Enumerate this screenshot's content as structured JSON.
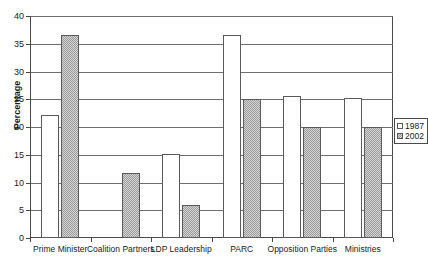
{
  "chart_data": {
    "type": "bar",
    "title": "",
    "xlabel": "",
    "ylabel": "Percentage",
    "ylim": [
      0,
      40
    ],
    "ytick_step": 5,
    "yticks": [
      "0",
      "5",
      "10",
      "15",
      "20",
      "25",
      "30",
      "35",
      "40"
    ],
    "grid": true,
    "legend_position": "right",
    "categories": [
      "Prime Minister",
      "Coalition Partners",
      "LDP Leadership",
      "PARC",
      "Opposition Parties",
      "Ministries"
    ],
    "series": [
      {
        "name": "1987",
        "fill": "white",
        "values": [
          22.2,
          0,
          15.2,
          36.5,
          25.5,
          25.3
        ]
      },
      {
        "name": "2002",
        "fill": "hatched-gray",
        "values": [
          36.5,
          11.8,
          6.0,
          25.0,
          20.0,
          20.0
        ]
      }
    ]
  },
  "legend": {
    "entries": [
      {
        "label": "1987"
      },
      {
        "label": "2002"
      }
    ]
  },
  "colors": {
    "series_1987": "#ffffff",
    "series_2002": "#9d9d9d",
    "axis": "#4a4a4a",
    "gridline": "#6e6e6e",
    "text": "#1b1b1b",
    "background": "#ffffff"
  }
}
